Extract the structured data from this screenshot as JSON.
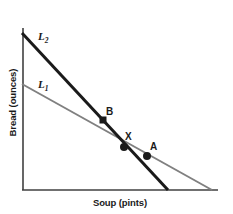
{
  "chart_data": {
    "type": "line",
    "title": "",
    "xlabel": "Soup (pints)",
    "ylabel": "Bread (ounces)",
    "xlim": [
      0,
      100
    ],
    "ylim": [
      0,
      100
    ],
    "grid": false,
    "legend": "none",
    "axis_ticks": [],
    "series": [
      {
        "name": "L1",
        "label": "L",
        "subscript": "1",
        "color": "#808080",
        "width": 2,
        "x": [
          0,
          97
        ],
        "y": [
          65,
          0
        ],
        "endpoints_px": [
          [
            22,
            84
          ],
          [
            212,
            190
          ]
        ]
      },
      {
        "name": "L2",
        "label": "L",
        "subscript": "2",
        "color": "#1a1a1a",
        "width": 3,
        "x": [
          0,
          75
        ],
        "y": [
          97,
          0
        ],
        "endpoints_px": [
          [
            22,
            33
          ],
          [
            168,
            190
          ]
        ]
      }
    ],
    "points": [
      {
        "label": "B",
        "marker": "square",
        "color": "#1a1a1a",
        "on_series": "L2",
        "x": 41,
        "y": 43,
        "px": [
          103,
          120
        ]
      },
      {
        "label": "X",
        "marker": "circle",
        "color": "#1a1a1a",
        "on_series": "L1,L2",
        "x": 52,
        "y": 27,
        "px": [
          124,
          147
        ]
      },
      {
        "label": "A",
        "marker": "circle",
        "color": "#1a1a1a",
        "on_series": "L1",
        "x": 64,
        "y": 21,
        "px": [
          147,
          156
        ]
      }
    ],
    "axis_color": "#404040",
    "background": "#ffffff"
  }
}
